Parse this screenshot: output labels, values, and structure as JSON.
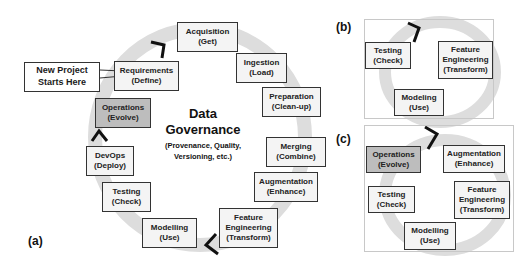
{
  "panel_a": {
    "label": "(a)",
    "center": {
      "title_line1": "Data",
      "title_line2": "Governance",
      "subtitle_line1": "(Provenance, Quality,",
      "subtitle_line2": "Versioning, etc.)"
    },
    "callout": {
      "line1": "New Project",
      "line2": "Starts Here"
    },
    "steps": [
      {
        "name": "Requirements",
        "sub": "(Define)"
      },
      {
        "name": "Acquisition",
        "sub": "(Get)"
      },
      {
        "name": "Ingestion",
        "sub": "(Load)"
      },
      {
        "name": "Preparation",
        "sub": "(Clean-up)"
      },
      {
        "name": "Merging",
        "sub": "(Combine)"
      },
      {
        "name": "Augmentation",
        "sub": "(Enhance)"
      },
      {
        "name": "Feature",
        "name2": "Engineering",
        "sub": "(Transform)"
      },
      {
        "name": "Modelling",
        "sub": "(Use)"
      },
      {
        "name": "Testing",
        "sub": "(Check)"
      },
      {
        "name": "DevOps",
        "sub": "(Deploy)"
      },
      {
        "name": "Operations",
        "sub": "(Evolve)"
      }
    ]
  },
  "panel_b": {
    "label": "(b)",
    "steps": [
      {
        "name": "Testing",
        "sub": "(Check)"
      },
      {
        "name": "Feature",
        "name2": "Engineering",
        "sub": "(Transform)"
      },
      {
        "name": "Modeling",
        "sub": "(Use)"
      }
    ]
  },
  "panel_c": {
    "label": "(c)",
    "steps": [
      {
        "name": "Operations",
        "sub": "(Evolve)"
      },
      {
        "name": "Augmentation",
        "sub": "(Enhance)"
      },
      {
        "name": "Testing",
        "sub": "(Check)"
      },
      {
        "name": "Feature",
        "name2": "Engineering",
        "sub": "(Transform)"
      },
      {
        "name": "Modelling",
        "sub": "(Use)"
      }
    ]
  },
  "colors": {
    "box_fill": "#f4f4f4",
    "highlight_fill": "#bdbdbd",
    "ring": "#dcdcdc",
    "border": "#333333"
  }
}
